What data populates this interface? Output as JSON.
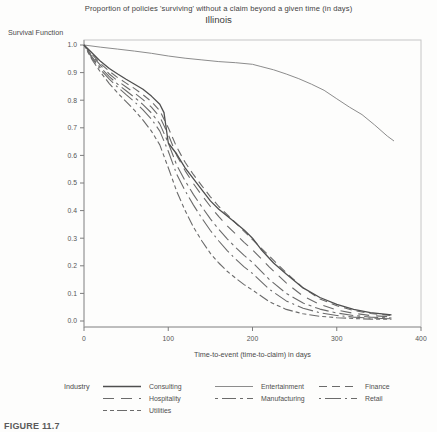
{
  "figure_caption": "FIGURE 11.7",
  "chart_data": {
    "type": "line",
    "title": "Proportion of policies 'surviving' without a claim beyond a given time (in days)",
    "subtitle": "Illinois",
    "xlabel": "Time-to-event (time-to-claim) in days",
    "ylabel": "Survival Function",
    "legend_title": "Industry",
    "legend_position": "bottom",
    "grid": false,
    "xlim": [
      0,
      400
    ],
    "ylim": [
      0.0,
      1.0
    ],
    "x_ticks": [
      0,
      100,
      200,
      300,
      400
    ],
    "y_ticks": [
      1.0,
      0.9,
      0.8,
      0.7,
      0.6,
      0.5,
      0.4,
      0.3,
      0.2,
      0.1,
      0.0
    ],
    "frame_color": "#c6c6c6",
    "axis_color": "#9a9a9a",
    "tick_color": "#7d7d7d",
    "series": [
      {
        "name": "Consulting",
        "dash": "",
        "color": "#4f4f4f",
        "width": 1.3,
        "x": [
          0,
          10,
          20,
          30,
          40,
          50,
          60,
          70,
          80,
          90,
          95,
          100,
          110,
          120,
          130,
          140,
          150,
          160,
          170,
          180,
          190,
          200,
          210,
          225,
          240,
          260,
          280,
          300,
          320,
          340,
          365
        ],
        "y": [
          1.0,
          0.97,
          0.94,
          0.915,
          0.895,
          0.876,
          0.858,
          0.84,
          0.815,
          0.785,
          0.755,
          0.645,
          0.605,
          0.555,
          0.515,
          0.475,
          0.435,
          0.405,
          0.38,
          0.355,
          0.33,
          0.3,
          0.26,
          0.21,
          0.17,
          0.12,
          0.085,
          0.06,
          0.042,
          0.03,
          0.022
        ]
      },
      {
        "name": "Entertainment",
        "dash": "",
        "color": "#8c8c8c",
        "width": 1.0,
        "x": [
          0,
          20,
          40,
          60,
          80,
          100,
          120,
          140,
          160,
          180,
          200,
          210,
          225,
          240,
          255,
          270,
          285,
          300,
          315,
          330,
          345,
          360,
          368
        ],
        "y": [
          1.0,
          0.992,
          0.985,
          0.978,
          0.97,
          0.96,
          0.952,
          0.946,
          0.94,
          0.936,
          0.93,
          0.922,
          0.91,
          0.895,
          0.878,
          0.858,
          0.836,
          0.805,
          0.775,
          0.748,
          0.71,
          0.67,
          0.652
        ]
      },
      {
        "name": "Finance",
        "dash": "8 5",
        "color": "#6b6b6b",
        "width": 1.1,
        "x": [
          0,
          10,
          20,
          30,
          40,
          50,
          60,
          70,
          80,
          90,
          100,
          110,
          120,
          130,
          140,
          150,
          160,
          170,
          180,
          190,
          200,
          220,
          240,
          260,
          280,
          300,
          320,
          340,
          365
        ],
        "y": [
          1.0,
          0.965,
          0.932,
          0.905,
          0.882,
          0.862,
          0.842,
          0.82,
          0.795,
          0.762,
          0.7,
          0.63,
          0.575,
          0.53,
          0.49,
          0.45,
          0.415,
          0.385,
          0.355,
          0.325,
          0.295,
          0.235,
          0.175,
          0.12,
          0.08,
          0.055,
          0.038,
          0.027,
          0.02
        ]
      },
      {
        "name": "Hospitality",
        "dash": "11 7",
        "color": "#6b6b6b",
        "width": 1.1,
        "x": [
          0,
          10,
          20,
          30,
          40,
          50,
          60,
          70,
          80,
          90,
          100,
          110,
          120,
          130,
          140,
          150,
          160,
          170,
          180,
          190,
          200,
          220,
          240,
          260,
          280,
          300,
          320,
          340,
          365
        ],
        "y": [
          1.0,
          0.96,
          0.925,
          0.895,
          0.87,
          0.848,
          0.826,
          0.802,
          0.775,
          0.74,
          0.675,
          0.6,
          0.545,
          0.497,
          0.455,
          0.415,
          0.378,
          0.345,
          0.315,
          0.285,
          0.258,
          0.195,
          0.138,
          0.09,
          0.06,
          0.04,
          0.028,
          0.02,
          0.015
        ]
      },
      {
        "name": "Manufacturing",
        "dash": "3 4 14 4",
        "color": "#6b6b6b",
        "width": 1.1,
        "x": [
          0,
          10,
          20,
          30,
          40,
          50,
          60,
          70,
          80,
          90,
          100,
          110,
          120,
          130,
          140,
          150,
          160,
          170,
          180,
          190,
          200,
          220,
          240,
          260,
          280,
          300,
          320,
          340,
          365
        ],
        "y": [
          1.0,
          0.955,
          0.917,
          0.885,
          0.858,
          0.834,
          0.81,
          0.784,
          0.754,
          0.714,
          0.645,
          0.565,
          0.508,
          0.458,
          0.413,
          0.37,
          0.332,
          0.298,
          0.266,
          0.238,
          0.212,
          0.15,
          0.1,
          0.065,
          0.043,
          0.029,
          0.02,
          0.014,
          0.011
        ]
      },
      {
        "name": "Retail",
        "dash": "2 4 16 4",
        "color": "#6b6b6b",
        "width": 1.1,
        "x": [
          0,
          10,
          20,
          30,
          40,
          50,
          60,
          70,
          80,
          90,
          100,
          110,
          120,
          130,
          140,
          150,
          160,
          170,
          180,
          190,
          200,
          220,
          240,
          260,
          280,
          300,
          320,
          340,
          365
        ],
        "y": [
          1.0,
          0.95,
          0.91,
          0.876,
          0.847,
          0.82,
          0.794,
          0.765,
          0.732,
          0.688,
          0.615,
          0.532,
          0.472,
          0.42,
          0.372,
          0.328,
          0.29,
          0.255,
          0.224,
          0.196,
          0.172,
          0.115,
          0.073,
          0.046,
          0.03,
          0.02,
          0.014,
          0.01,
          0.008
        ]
      },
      {
        "name": "Utilities",
        "dash": "4 3 4 3 10 3",
        "color": "#6b6b6b",
        "width": 1.1,
        "x": [
          0,
          10,
          20,
          30,
          40,
          50,
          60,
          70,
          80,
          90,
          100,
          110,
          120,
          130,
          140,
          150,
          160,
          170,
          180,
          190,
          200,
          220,
          240,
          260,
          280,
          300,
          320,
          340,
          365
        ],
        "y": [
          1.0,
          0.945,
          0.9,
          0.86,
          0.826,
          0.795,
          0.763,
          0.728,
          0.688,
          0.638,
          0.555,
          0.47,
          0.4,
          0.34,
          0.29,
          0.245,
          0.21,
          0.18,
          0.155,
          0.132,
          0.112,
          0.07,
          0.042,
          0.026,
          0.017,
          0.012,
          0.009,
          0.007,
          0.006
        ]
      }
    ]
  }
}
